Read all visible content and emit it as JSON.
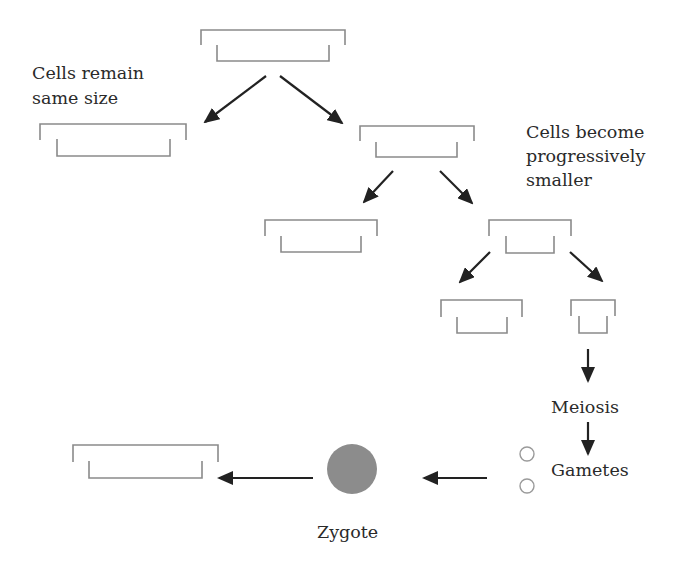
{
  "diagram": {
    "labels": {
      "same_size": [
        "Cells remain",
        "same size"
      ],
      "smaller": [
        "Cells become",
        "progressively",
        "smaller"
      ],
      "meiosis": "Meiosis",
      "gametes": "Gametes",
      "zygote": "Zygote"
    },
    "colors": {
      "bracket": "#8a8a8a",
      "arrow": "#222222",
      "zygote": "#8c8c8c",
      "gamete_outline": "#9a9a9a",
      "text": "#2a2a2a"
    },
    "cells": [
      {
        "id": "parent",
        "outer": [
          201,
          345,
          30,
          45
        ],
        "inner": [
          217,
          329,
          45,
          61
        ]
      },
      {
        "id": "left-1",
        "outer": [
          40,
          186,
          124,
          140
        ],
        "inner": [
          57,
          170,
          139,
          156
        ]
      },
      {
        "id": "right-1",
        "outer": [
          360,
          474,
          126,
          141
        ],
        "inner": [
          376,
          457,
          142,
          157
        ]
      },
      {
        "id": "left-2",
        "outer": [
          265,
          377,
          220,
          236
        ],
        "inner": [
          281,
          361,
          236,
          252
        ]
      },
      {
        "id": "right-2",
        "outer": [
          489,
          571,
          220,
          236
        ],
        "inner": [
          506,
          554,
          236,
          253
        ]
      },
      {
        "id": "left-3",
        "outer": [
          441,
          522,
          300,
          317
        ],
        "inner": [
          457,
          507,
          317,
          333
        ]
      },
      {
        "id": "right-3",
        "outer": [
          571,
          615,
          300,
          316
        ],
        "inner": [
          579,
          607,
          316,
          333
        ]
      },
      {
        "id": "offspring",
        "outer": [
          73,
          218,
          445,
          462
        ],
        "inner": [
          89,
          202,
          461,
          478
        ]
      }
    ]
  }
}
